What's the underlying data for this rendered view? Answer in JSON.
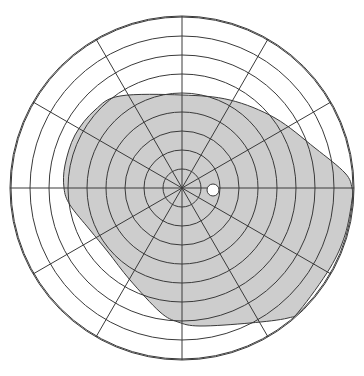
{
  "diagram": {
    "type": "visual-field-perimetry-chart",
    "title": "",
    "center": {
      "x": 182,
      "y": 188
    },
    "ring_spacing_px": 19,
    "ring_count": 9,
    "outer_radius_px": 172,
    "spoke_count": 12,
    "spoke_step_deg": 30,
    "colors": {
      "background": "#ffffff",
      "grid_line": "#3a3a3a",
      "field_fill": "#cdcdcd",
      "blind_spot_fill": "#ffffff"
    },
    "field_boundary": {
      "description": "Shaded visual field region, offset toward lower-right",
      "points": [
        [
          120,
          96
        ],
        [
          182,
          95
        ],
        [
          230,
          100
        ],
        [
          275,
          118
        ],
        [
          315,
          148
        ],
        [
          345,
          173
        ],
        [
          352,
          188
        ],
        [
          352,
          200
        ],
        [
          345,
          235
        ],
        [
          330,
          268
        ],
        [
          300,
          310
        ],
        [
          288,
          318
        ],
        [
          250,
          323
        ],
        [
          200,
          326
        ],
        [
          178,
          322
        ],
        [
          160,
          312
        ],
        [
          130,
          280
        ],
        [
          108,
          252
        ],
        [
          90,
          230
        ],
        [
          70,
          205
        ],
        [
          64,
          188
        ],
        [
          65,
          165
        ],
        [
          75,
          135
        ],
        [
          95,
          110
        ]
      ]
    },
    "blind_spot": {
      "cx": 213,
      "cy": 190,
      "r": 6
    }
  }
}
